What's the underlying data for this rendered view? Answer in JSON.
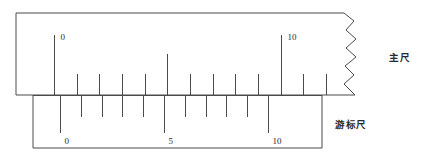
{
  "figure": {
    "stroke_color": "#4a4a4a",
    "text_color": "#2a2a2a",
    "background": "#ffffff"
  },
  "main_scale": {
    "name": "main-scale",
    "label": "主尺",
    "label_x": 389,
    "label_y": 53,
    "box": {
      "x": 16,
      "y": 13,
      "width": 354,
      "height": 82
    },
    "broken_edge": true,
    "baseline_y": 95,
    "tick_origin_x": 54,
    "tick_spacing": 22.65,
    "tick_count": 15,
    "tick_short_length": 21,
    "tick_medium_length": 41,
    "tick_long_length": 60,
    "numbered_ticks": [
      {
        "index": 0,
        "value": "0",
        "label_dx": 6,
        "label_dy": -2
      },
      {
        "index": 10,
        "value": "10",
        "label_dx": 6,
        "label_dy": -2
      }
    ],
    "medium_tick_indices": [
      5
    ]
  },
  "vernier_scale": {
    "name": "vernier-scale",
    "label": "游标尺",
    "label_x": 335,
    "label_y": 120,
    "box": {
      "x": 33,
      "y": 95,
      "width": 289,
      "height": 53
    },
    "baseline_y": 95,
    "tick_origin_x": 60,
    "tick_spacing": 20.8,
    "tick_count": 11,
    "tick_short_length": 22,
    "tick_long_length": 38,
    "numbered_ticks": [
      {
        "index": 0,
        "value": "0",
        "label_dx": 4,
        "label_dy": 4
      },
      {
        "index": 5,
        "value": "5",
        "label_dx": 4,
        "label_dy": 4
      },
      {
        "index": 10,
        "value": "10",
        "label_dx": 4,
        "label_dy": 4
      }
    ],
    "long_tick_indices": [
      0,
      5,
      10
    ]
  },
  "chart_data": {
    "type": "diagram",
    "series": [
      {
        "name": "主尺",
        "tick_values": [
          0,
          1,
          2,
          3,
          4,
          5,
          6,
          7,
          8,
          9,
          10,
          11,
          12,
          13,
          14
        ],
        "labeled_values": [
          0,
          10
        ],
        "unit_division_px": 22.65
      },
      {
        "name": "游标尺",
        "tick_values": [
          0,
          1,
          2,
          3,
          4,
          5,
          6,
          7,
          8,
          9,
          10
        ],
        "labeled_values": [
          0,
          5,
          10
        ],
        "unit_division_px": 20.8
      }
    ]
  }
}
